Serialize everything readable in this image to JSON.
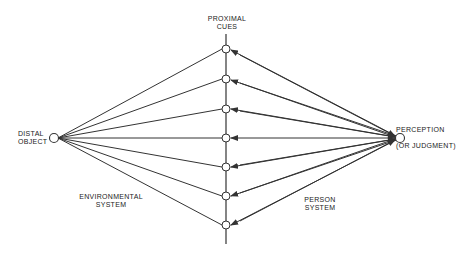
{
  "diagram": {
    "type": "lens-model",
    "distal": {
      "line1": "DISTAL",
      "line2": "OBJECT"
    },
    "cues_label": {
      "line1": "PROXIMAL",
      "line2": "CUES"
    },
    "perception": {
      "line1": "PERCEPTION",
      "line2": "(OR JUDGMENT)"
    },
    "env_system": {
      "line1": "ENVIRONMENTAL",
      "line2": "SYSTEM"
    },
    "person_system": {
      "line1": "PERSON",
      "line2": "SYSTEM"
    },
    "cue_count": 7,
    "colors": {
      "line": "#333333",
      "background": "#ffffff"
    }
  }
}
